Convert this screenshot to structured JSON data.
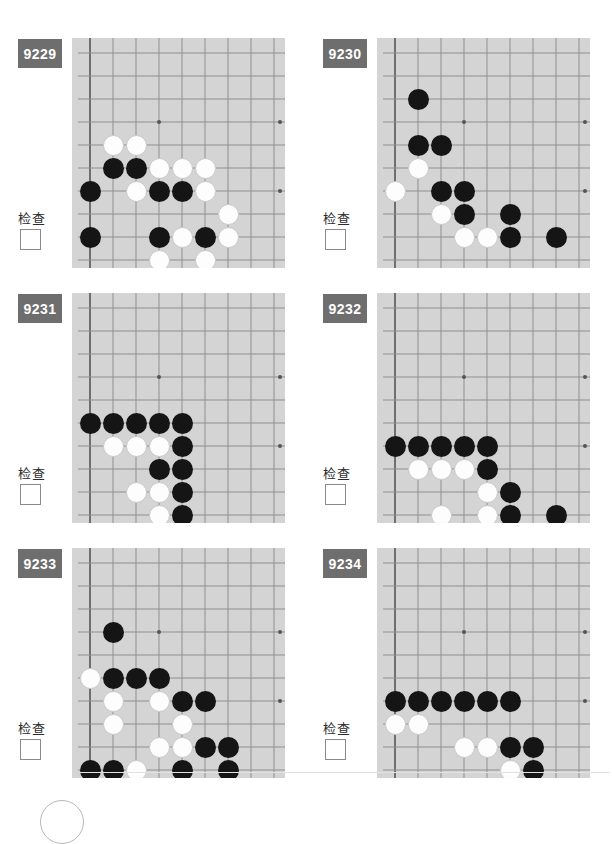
{
  "page": {
    "width": 612,
    "height": 818,
    "columns": 2,
    "rows": 3,
    "colors": {
      "board_background": "#d4d4d4",
      "grid_line": "#8f8f8f",
      "board_edge": "#6f6f6f",
      "black_stone": "#151515",
      "white_stone": "#fdfdfd",
      "badge_background": "#6e6e6e",
      "badge_text": "#ffffff",
      "page_background": "#ffffff"
    }
  },
  "board_geometry": {
    "cell_size": 23,
    "stone_diameter": 21,
    "origin_x": 18,
    "origin_y": 15,
    "cols": 9,
    "rows": 9,
    "star_points": [
      [
        3,
        3
      ]
    ],
    "edge_left": true,
    "edge_bottom": true,
    "note": "Lower-left corner of a 19x19 board; coordinates are [col,row] with col 0 = left board edge line, row 0 = top of visible crop."
  },
  "problems": [
    {
      "id": "9229",
      "check_label": "检查",
      "checkbox_checked": false,
      "black": [
        [
          1,
          5
        ],
        [
          2,
          5
        ],
        [
          0,
          6
        ],
        [
          3,
          6
        ],
        [
          4,
          6
        ],
        [
          0,
          8
        ],
        [
          3,
          8
        ],
        [
          5,
          8
        ]
      ],
      "white": [
        [
          1,
          4
        ],
        [
          2,
          4
        ],
        [
          3,
          5
        ],
        [
          4,
          5
        ],
        [
          5,
          5
        ],
        [
          2,
          6
        ],
        [
          5,
          6
        ],
        [
          6,
          7
        ],
        [
          4,
          8
        ],
        [
          6,
          8
        ],
        [
          3,
          9
        ],
        [
          5,
          9
        ]
      ]
    },
    {
      "id": "9230",
      "check_label": "检查",
      "checkbox_checked": false,
      "black": [
        [
          1,
          2
        ],
        [
          1,
          4
        ],
        [
          2,
          4
        ],
        [
          2,
          6
        ],
        [
          3,
          6
        ],
        [
          3,
          7
        ],
        [
          5,
          7
        ],
        [
          5,
          8
        ],
        [
          7,
          8
        ]
      ],
      "white": [
        [
          1,
          5
        ],
        [
          0,
          6
        ],
        [
          2,
          7
        ],
        [
          3,
          8
        ],
        [
          4,
          8
        ]
      ]
    },
    {
      "id": "9231",
      "check_label": "检查",
      "checkbox_checked": false,
      "black": [
        [
          0,
          5
        ],
        [
          1,
          5
        ],
        [
          2,
          5
        ],
        [
          3,
          5
        ],
        [
          4,
          5
        ],
        [
          4,
          6
        ],
        [
          3,
          7
        ],
        [
          4,
          7
        ],
        [
          4,
          8
        ],
        [
          4,
          9
        ],
        [
          4,
          10
        ]
      ],
      "white": [
        [
          1,
          6
        ],
        [
          2,
          6
        ],
        [
          3,
          6
        ],
        [
          2,
          8
        ],
        [
          3,
          8
        ],
        [
          3,
          9
        ],
        [
          3,
          10
        ]
      ]
    },
    {
      "id": "9232",
      "check_label": "检查",
      "checkbox_checked": false,
      "black": [
        [
          0,
          6
        ],
        [
          1,
          6
        ],
        [
          2,
          6
        ],
        [
          3,
          6
        ],
        [
          4,
          6
        ],
        [
          4,
          7
        ],
        [
          5,
          8
        ],
        [
          5,
          9
        ],
        [
          7,
          9
        ],
        [
          4,
          10
        ]
      ],
      "white": [
        [
          1,
          7
        ],
        [
          2,
          7
        ],
        [
          3,
          7
        ],
        [
          4,
          8
        ],
        [
          2,
          9
        ],
        [
          4,
          9
        ]
      ]
    },
    {
      "id": "9233",
      "check_label": "检查",
      "checkbox_checked": false,
      "black": [
        [
          1,
          3
        ],
        [
          1,
          5
        ],
        [
          2,
          5
        ],
        [
          3,
          5
        ],
        [
          4,
          6
        ],
        [
          5,
          6
        ],
        [
          5,
          8
        ],
        [
          6,
          8
        ],
        [
          0,
          9
        ],
        [
          1,
          9
        ],
        [
          4,
          9
        ],
        [
          6,
          9
        ],
        [
          1,
          10
        ],
        [
          5,
          10
        ]
      ],
      "white": [
        [
          0,
          5
        ],
        [
          1,
          6
        ],
        [
          3,
          6
        ],
        [
          1,
          7
        ],
        [
          4,
          7
        ],
        [
          3,
          8
        ],
        [
          4,
          8
        ],
        [
          2,
          9
        ],
        [
          2,
          10
        ]
      ]
    },
    {
      "id": "9234",
      "check_label": "检查",
      "checkbox_checked": false,
      "black": [
        [
          0,
          6
        ],
        [
          1,
          6
        ],
        [
          2,
          6
        ],
        [
          3,
          6
        ],
        [
          4,
          6
        ],
        [
          5,
          6
        ],
        [
          5,
          8
        ],
        [
          6,
          8
        ],
        [
          6,
          9
        ],
        [
          6,
          10
        ]
      ],
      "white": [
        [
          0,
          7
        ],
        [
          1,
          7
        ],
        [
          3,
          8
        ],
        [
          4,
          8
        ],
        [
          5,
          9
        ],
        [
          4,
          10
        ],
        [
          5,
          10
        ]
      ]
    }
  ]
}
